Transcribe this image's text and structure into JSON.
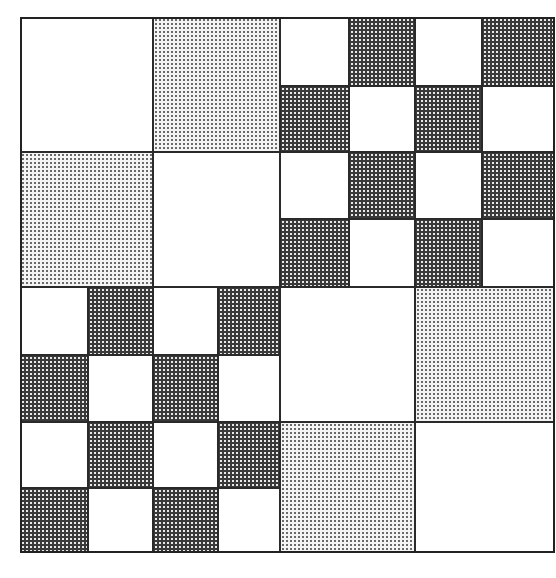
{
  "figure": {
    "fills": {
      "W": "white",
      "L": "light-dotted",
      "D": "dark-dotted"
    },
    "colors": {
      "line": "#2a2a2a",
      "light_dot": "#6a6a6a",
      "dark_fill": "#3a3a3a",
      "white": "#ffffff"
    },
    "quadrants": [
      {
        "name": "top-left",
        "x": 0,
        "y": 0,
        "w": 260,
        "h": 270,
        "cols": [
          0,
          133,
          260
        ],
        "rows": [
          0,
          135,
          270
        ],
        "grid": [
          [
            "W",
            "L"
          ],
          [
            "L",
            "W"
          ]
        ]
      },
      {
        "name": "top-right",
        "x": 260,
        "y": 0,
        "w": 275,
        "h": 270,
        "cols": [
          0,
          69,
          135,
          202,
          275
        ],
        "rows": [
          0,
          69,
          135,
          202,
          270
        ],
        "grid": [
          [
            "W",
            "D",
            "W",
            "D"
          ],
          [
            "D",
            "W",
            "D",
            "W"
          ],
          [
            "W",
            "D",
            "W",
            "D"
          ],
          [
            "D",
            "W",
            "D",
            "W"
          ]
        ]
      },
      {
        "name": "bottom-left",
        "x": 0,
        "y": 270,
        "w": 260,
        "h": 266,
        "cols": [
          0,
          68,
          133,
          198,
          260
        ],
        "rows": [
          0,
          68,
          135,
          201,
          266
        ],
        "grid": [
          [
            "W",
            "D",
            "W",
            "D"
          ],
          [
            "D",
            "W",
            "D",
            "W"
          ],
          [
            "W",
            "D",
            "W",
            "D"
          ],
          [
            "D",
            "W",
            "D",
            "W"
          ]
        ]
      },
      {
        "name": "bottom-right",
        "x": 260,
        "y": 270,
        "w": 275,
        "h": 266,
        "cols": [
          0,
          135,
          275
        ],
        "rows": [
          0,
          135,
          266
        ],
        "grid": [
          [
            "W",
            "L"
          ],
          [
            "L",
            "W"
          ]
        ]
      }
    ]
  }
}
